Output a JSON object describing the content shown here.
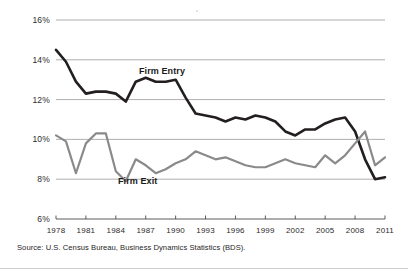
{
  "chart_data": {
    "type": "line",
    "title": "",
    "subtitle": "",
    "xlabel": "",
    "ylabel": "",
    "ylim": [
      6,
      16
    ],
    "xlim": [
      1978,
      2011
    ],
    "grid": true,
    "gridlines_y": [
      8,
      10,
      12,
      14,
      16
    ],
    "ytick_labels": [
      "6%",
      "8%",
      "10%",
      "12%",
      "14%",
      "16%"
    ],
    "ytick_values": [
      6,
      8,
      10,
      12,
      14,
      16
    ],
    "xtick_labels": [
      "1978",
      "1981",
      "1984",
      "1987",
      "1990",
      "1993",
      "1996",
      "1999",
      "2002",
      "2005",
      "2008",
      "2011"
    ],
    "xtick_values": [
      1978,
      1981,
      1984,
      1987,
      1990,
      1993,
      1996,
      1999,
      2002,
      2005,
      2008,
      2011
    ],
    "legend_position": "inline-annotation",
    "x": [
      1978,
      1979,
      1980,
      1981,
      1982,
      1983,
      1984,
      1985,
      1986,
      1987,
      1988,
      1989,
      1990,
      1991,
      1992,
      1993,
      1994,
      1995,
      1996,
      1997,
      1998,
      1999,
      2000,
      2001,
      2002,
      2003,
      2004,
      2005,
      2006,
      2007,
      2008,
      2009,
      2010,
      2011
    ],
    "series": [
      {
        "name": "Firm Entry",
        "color": "#231f20",
        "annotation": "Firm Entry",
        "values": [
          14.5,
          13.9,
          12.9,
          12.3,
          12.4,
          12.4,
          12.3,
          11.9,
          12.9,
          13.1,
          12.9,
          12.9,
          13.0,
          12.1,
          11.3,
          11.2,
          11.1,
          10.9,
          11.1,
          11.0,
          11.2,
          11.1,
          10.9,
          10.4,
          10.2,
          10.5,
          10.5,
          10.8,
          11.0,
          11.1,
          10.4,
          9.0,
          8.0,
          8.1
        ]
      },
      {
        "name": "Firm Exit",
        "color": "#8a8a8a",
        "annotation": "Firm Exit",
        "values": [
          10.2,
          9.9,
          8.3,
          9.8,
          10.3,
          10.3,
          8.4,
          7.9,
          9.0,
          8.7,
          8.3,
          8.5,
          8.8,
          9.0,
          9.4,
          9.2,
          9.0,
          9.1,
          8.9,
          8.7,
          8.6,
          8.6,
          8.8,
          9.0,
          8.8,
          8.7,
          8.6,
          9.2,
          8.8,
          9.2,
          9.8,
          10.4,
          8.7,
          9.1
        ]
      }
    ],
    "annotations": [
      {
        "text": "Firm Entry",
        "x_px": 139,
        "y_px": 74
      },
      {
        "text": "Firm Exit",
        "x_px": 118,
        "y_px": 184
      }
    ],
    "source": "Source: U.S. Census Bureau, Business Dynamics Statistics (BDS)."
  },
  "figure": {
    "source_note": "Source: U.S. Census Bureau, Business Dynamics Statistics (BDS)."
  }
}
